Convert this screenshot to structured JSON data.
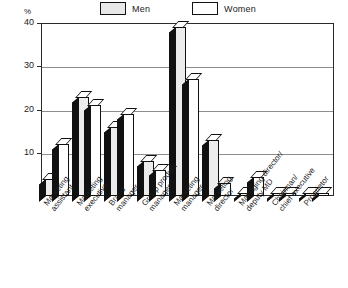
{
  "chart_data": {
    "type": "bar",
    "title": "",
    "subtitle": "",
    "xlabel": "",
    "ylabel": "%",
    "ylim": [
      0,
      40
    ],
    "yticks": [
      0,
      10,
      20,
      30,
      40
    ],
    "ytick_labels": [
      "",
      "10",
      "20",
      "30",
      "40"
    ],
    "grid": true,
    "legend_position": "top-center",
    "categories": [
      "Marketing assistant",
      "Marketing executive",
      "Brand manager",
      "Group product manager",
      "Marketing manager",
      "Marketing director",
      "Managing director/ deputy MD",
      "Chairman/ chief executive",
      "Proprietor"
    ],
    "category_lines": [
      [
        "Marketing",
        "assistant"
      ],
      [
        "Marketing",
        "executive"
      ],
      [
        "Brand",
        "manager"
      ],
      [
        "Group product",
        "manager"
      ],
      [
        "Marketing",
        "manager"
      ],
      [
        "Marketing",
        "director"
      ],
      [
        "Managing director/",
        "deputy MD"
      ],
      [
        "Chairman/",
        "chief executive"
      ],
      [
        "Proprietor"
      ]
    ],
    "series": [
      {
        "name": "Men",
        "color": "#ececec",
        "values": [
          4,
          23,
          16,
          8,
          39,
          13,
          0,
          0,
          0
        ]
      },
      {
        "name": "Women",
        "color": "#ffffff",
        "values": [
          12,
          21,
          19,
          6,
          27,
          3,
          4.5,
          0,
          0
        ]
      }
    ]
  },
  "legend": {
    "entries": [
      {
        "label": "Men",
        "swatch": "men-swatch"
      },
      {
        "label": "Women",
        "swatch": "women-swatch"
      }
    ]
  },
  "axis": {
    "unit_label": "%",
    "ticks": [
      "40",
      "30",
      "20",
      "10"
    ]
  },
  "colors": {
    "men_fill": "#ececec",
    "women_fill": "#ffffff",
    "outline": "#111111",
    "grid": "#8d8d8d",
    "depth_shadow": "#111111"
  }
}
